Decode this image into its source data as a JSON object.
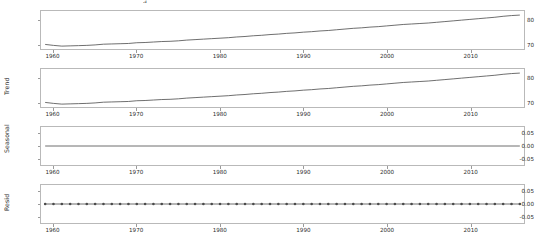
{
  "figure": {
    "title_fragment": "d",
    "background_color": "#ffffff",
    "line_color": "#4a4a4a",
    "axis_color": "#b9b9b9"
  },
  "chart_data": {
    "type": "line",
    "xlabel": "",
    "grid": false,
    "legend": null,
    "shared_x": true,
    "x_ticks": [
      "1960",
      "1970",
      "1980",
      "1990",
      "2000",
      "2010"
    ],
    "x_tick_values": [
      1960,
      1970,
      1980,
      1990,
      2000,
      2010
    ],
    "xlim": [
      1958.5,
      2016.5
    ],
    "panels": [
      {
        "name": "observed",
        "ylabel": "",
        "y_ticks": [
          "80",
          "70"
        ],
        "y_tick_values": [
          80,
          70
        ],
        "ylim": [
          68.2,
          84.0
        ],
        "marker": "none",
        "x": [
          1959,
          1960,
          1961,
          1962,
          1963,
          1964,
          1965,
          1966,
          1967,
          1968,
          1969,
          1970,
          1971,
          1972,
          1973,
          1974,
          1975,
          1976,
          1977,
          1978,
          1979,
          1980,
          1981,
          1982,
          1983,
          1984,
          1985,
          1986,
          1987,
          1988,
          1989,
          1990,
          1991,
          1992,
          1993,
          1994,
          1995,
          1996,
          1997,
          1998,
          1999,
          2000,
          2001,
          2002,
          2003,
          2004,
          2005,
          2006,
          2007,
          2008,
          2009,
          2010,
          2011,
          2012,
          2013,
          2014,
          2015,
          2016
        ],
        "values": [
          70.1,
          69.7,
          69.4,
          69.5,
          69.6,
          69.7,
          69.9,
          70.2,
          70.3,
          70.4,
          70.5,
          70.8,
          70.9,
          71.1,
          71.3,
          71.4,
          71.6,
          71.9,
          72.1,
          72.3,
          72.5,
          72.7,
          72.9,
          73.2,
          73.4,
          73.7,
          73.9,
          74.2,
          74.4,
          74.7,
          74.9,
          75.2,
          75.4,
          75.7,
          75.9,
          76.2,
          76.5,
          76.8,
          77.0,
          77.3,
          77.5,
          77.8,
          78.1,
          78.4,
          78.6,
          78.8,
          79.0,
          79.3,
          79.6,
          79.9,
          80.2,
          80.5,
          80.8,
          81.1,
          81.4,
          81.8,
          82.1,
          82.3
        ]
      },
      {
        "name": "trend",
        "ylabel": "Trend",
        "y_ticks": [
          "80",
          "70"
        ],
        "y_tick_values": [
          80,
          70
        ],
        "ylim": [
          68.2,
          84.0
        ],
        "marker": "none",
        "x": [
          1959,
          1960,
          1961,
          1962,
          1963,
          1964,
          1965,
          1966,
          1967,
          1968,
          1969,
          1970,
          1971,
          1972,
          1973,
          1974,
          1975,
          1976,
          1977,
          1978,
          1979,
          1980,
          1981,
          1982,
          1983,
          1984,
          1985,
          1986,
          1987,
          1988,
          1989,
          1990,
          1991,
          1992,
          1993,
          1994,
          1995,
          1996,
          1997,
          1998,
          1999,
          2000,
          2001,
          2002,
          2003,
          2004,
          2005,
          2006,
          2007,
          2008,
          2009,
          2010,
          2011,
          2012,
          2013,
          2014,
          2015,
          2016
        ],
        "values": [
          70.1,
          69.7,
          69.4,
          69.5,
          69.6,
          69.7,
          69.9,
          70.2,
          70.3,
          70.4,
          70.5,
          70.8,
          70.9,
          71.1,
          71.3,
          71.4,
          71.6,
          71.9,
          72.1,
          72.3,
          72.5,
          72.7,
          72.9,
          73.2,
          73.4,
          73.7,
          73.9,
          74.2,
          74.4,
          74.7,
          74.9,
          75.2,
          75.4,
          75.7,
          75.9,
          76.2,
          76.5,
          76.8,
          77.0,
          77.3,
          77.5,
          77.8,
          78.1,
          78.4,
          78.6,
          78.8,
          79.0,
          79.3,
          79.6,
          79.9,
          80.2,
          80.5,
          80.8,
          81.1,
          81.4,
          81.8,
          82.1,
          82.3
        ]
      },
      {
        "name": "seasonal",
        "ylabel": "Seasonal",
        "y_ticks": [
          "0.05",
          "0.00",
          "-0.05"
        ],
        "y_tick_values": [
          0.05,
          0.0,
          -0.05
        ],
        "ylim": [
          -0.075,
          0.075
        ],
        "marker": "none",
        "x": [
          1959,
          2016
        ],
        "values": [
          0.0,
          0.0
        ]
      },
      {
        "name": "resid",
        "ylabel": "Resid",
        "y_ticks": [
          "0.05",
          "0.00",
          "-0.05"
        ],
        "y_tick_values": [
          0.05,
          0.0,
          -0.05
        ],
        "ylim": [
          -0.075,
          0.075
        ],
        "marker": "circle",
        "x": [
          1959,
          1960,
          1961,
          1962,
          1963,
          1964,
          1965,
          1966,
          1967,
          1968,
          1969,
          1970,
          1971,
          1972,
          1973,
          1974,
          1975,
          1976,
          1977,
          1978,
          1979,
          1980,
          1981,
          1982,
          1983,
          1984,
          1985,
          1986,
          1987,
          1988,
          1989,
          1990,
          1991,
          1992,
          1993,
          1994,
          1995,
          1996,
          1997,
          1998,
          1999,
          2000,
          2001,
          2002,
          2003,
          2004,
          2005,
          2006,
          2007,
          2008,
          2009,
          2010,
          2011,
          2012,
          2013,
          2014,
          2015,
          2016
        ],
        "values": [
          0,
          0,
          0,
          0,
          0,
          0,
          0,
          0,
          0,
          0,
          0,
          0,
          0,
          0,
          0,
          0,
          0,
          0,
          0,
          0,
          0,
          0,
          0,
          0,
          0,
          0,
          0,
          0,
          0,
          0,
          0,
          0,
          0,
          0,
          0,
          0,
          0,
          0,
          0,
          0,
          0,
          0,
          0,
          0,
          0,
          0,
          0,
          0,
          0,
          0,
          0,
          0,
          0,
          0,
          0,
          0,
          0,
          0
        ]
      }
    ]
  }
}
